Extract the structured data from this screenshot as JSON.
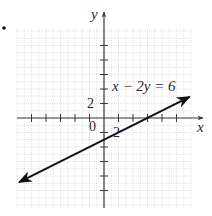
{
  "bullet": "•",
  "chart_data": {
    "type": "line",
    "title": "",
    "xlabel": "x",
    "ylabel": "y",
    "equation": "x − 2y = 6",
    "slope": 0.5,
    "y_intercept": -3,
    "x_intercept": 6,
    "tick_step": 2,
    "xlim": [
      -12,
      12
    ],
    "ylim": [
      -12,
      12
    ],
    "tick_labels": {
      "x": [
        "2"
      ],
      "y": [
        "2"
      ],
      "origin": "0"
    },
    "grid": true,
    "series": [
      {
        "name": "x − 2y = 6",
        "x": [
          -11.7,
          11.8
        ],
        "y": [
          -8.85,
          2.9
        ],
        "arrows": "both"
      }
    ]
  },
  "colors": {
    "axis": "#3a3a3a",
    "line": "#111111",
    "grid": "#c8c8c8",
    "text": "#2a2a2a"
  }
}
